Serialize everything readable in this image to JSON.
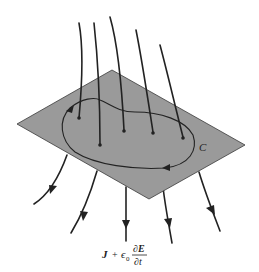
{
  "diagram": {
    "curve_label": "C",
    "formula": {
      "lhs": "J",
      "plus": "+",
      "epsilon": "ϵ",
      "subscript": "0",
      "numerator": "∂E",
      "denominator": "∂t"
    },
    "colors": {
      "plane_fill": "#9a9a9a",
      "line": "#222222",
      "background": "#ffffff"
    }
  }
}
